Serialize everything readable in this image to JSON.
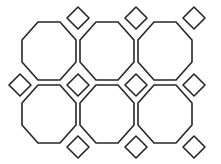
{
  "figure": {
    "type": "geometric-line-drawing",
    "width": 221,
    "height": 164,
    "background_color": "#ffffff",
    "stroke_color": "#262626",
    "stroke_width": 1.6,
    "fill": "none"
  },
  "chart_data": {
    "type": "diagram",
    "geometry": {
      "units": "pixels",
      "lattice_spacing_x": 58,
      "lattice_spacing_y": 62,
      "square_half_diagonal": 11,
      "octagon_flat_half_width": 11,
      "octagon_half_width": 27,
      "octagon_half_height": 29
    },
    "octagon_centers": [
      {
        "cx": 49,
        "cy": 51
      },
      {
        "cx": 107,
        "cy": 51
      },
      {
        "cx": 165,
        "cy": 51
      },
      {
        "cx": 49,
        "cy": 114
      },
      {
        "cx": 107,
        "cy": 114
      },
      {
        "cx": 165,
        "cy": 114
      }
    ],
    "square_centers": [
      {
        "cx": 78,
        "cy": 18
      },
      {
        "cx": 136,
        "cy": 18
      },
      {
        "cx": 194,
        "cy": 18
      },
      {
        "cx": 20,
        "cy": 85
      },
      {
        "cx": 78,
        "cy": 85
      },
      {
        "cx": 136,
        "cy": 85
      },
      {
        "cx": 194,
        "cy": 85
      },
      {
        "cx": 78,
        "cy": 147
      },
      {
        "cx": 136,
        "cy": 147
      },
      {
        "cx": 194,
        "cy": 147
      }
    ],
    "counts": {
      "octagons_visible": 6,
      "squares_visible": 10
    }
  }
}
